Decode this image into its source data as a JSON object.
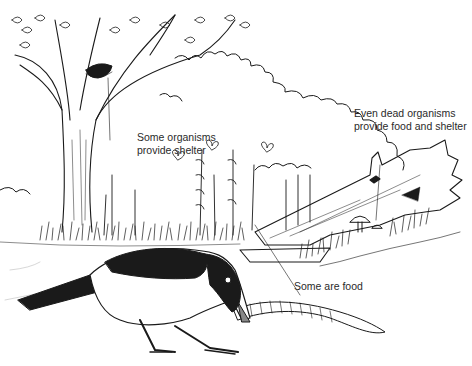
{
  "figure": {
    "kind": "line-illustration",
    "colors": {
      "ink": "#1a1a1a",
      "paper": "#ffffff",
      "label_text": "#2a2a2a"
    }
  },
  "labels": {
    "shelter": {
      "line1": "Some organisms",
      "line2": "provide shelter"
    },
    "dead": {
      "line1": "Even dead organisms",
      "line2": "provide food and shelter"
    },
    "food": {
      "line1": "Some are food"
    }
  },
  "elements": {
    "tree": "tree-with-nest",
    "nest": "bird-nest",
    "bird": "magpie",
    "worm": "earthworm",
    "log": "fallen-dead-tree",
    "mushrooms": "mushrooms",
    "butterflies": "butterflies",
    "flowers": "foxglove-spikes",
    "grass": "grass-strip",
    "hedge": "background-hedge"
  }
}
